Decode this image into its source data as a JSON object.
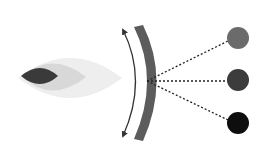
{
  "diagram": {
    "colors": {
      "background": "#ffffff",
      "outer_lens": "#eeeeee",
      "middle_lens": "#d6d6d6",
      "inner_lens": "#3a3a3a",
      "band": "#5a5a5a",
      "arrow": "#333333",
      "ray": "#222222",
      "circle_top": "#6b6b6b",
      "circle_middle": "#3c3c3c",
      "circle_bottom": "#0e0e0e"
    },
    "lens": {
      "outer": {
        "cx": 70,
        "cy": 78,
        "rx": 52,
        "ry": 24
      },
      "middle": {
        "cx": 55,
        "cy": 77,
        "rx": 30,
        "ry": 15
      },
      "inner": {
        "cx": 41,
        "cy": 76,
        "rx": 18,
        "ry": 8
      }
    },
    "focal_point": {
      "x": 148,
      "y": 81
    },
    "circles": [
      {
        "name": "top",
        "cx": 238,
        "cy": 38,
        "r": 11
      },
      {
        "name": "middle",
        "cx": 238,
        "cy": 80,
        "r": 11
      },
      {
        "name": "bottom",
        "cx": 238,
        "cy": 123,
        "r": 11
      }
    ]
  }
}
